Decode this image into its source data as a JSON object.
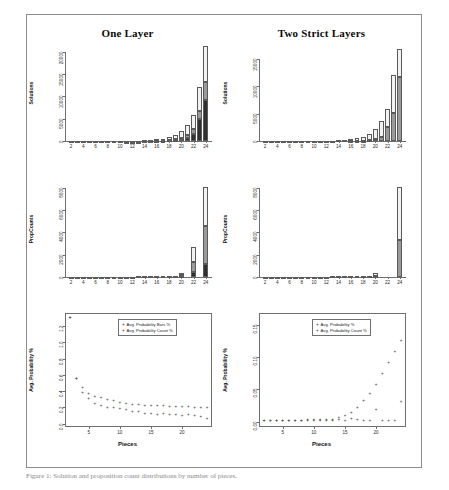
{
  "figure": {
    "caption": "Figure 1: Solution and proposition count distributions by number of pieces.",
    "panels": [
      {
        "id": "top-left",
        "title": "One Layer",
        "ylabel": "Solutions",
        "xlabel": ""
      },
      {
        "id": "top-right",
        "title": "Two Strict Layers",
        "ylabel": "Solutions",
        "xlabel": ""
      },
      {
        "id": "mid-left",
        "title": "",
        "ylabel": "PropCounts",
        "xlabel": ""
      },
      {
        "id": "mid-right",
        "title": "",
        "ylabel": "PropCounts",
        "xlabel": ""
      },
      {
        "id": "bottom-left",
        "title": "",
        "ylabel": "Avg. Probability %",
        "xlabel": "Pieces"
      },
      {
        "id": "bottom-right",
        "title": "",
        "ylabel": "Avg. Probability %",
        "xlabel": "Pieces"
      }
    ]
  },
  "colors": {
    "segment_top": "#f2f2f0",
    "segment_mid": "#9a9a9a",
    "segment_bottom": "#303030",
    "axis": "#6f6f6f",
    "frame": "#8d8d8d",
    "point": "#3a3a3a"
  },
  "chart_data": [
    {
      "type": "bar",
      "id": "top-left",
      "title": "One Layer",
      "xlabel": "",
      "ylabel": "Solutions",
      "xticks": [
        2,
        4,
        6,
        8,
        10,
        12,
        14,
        16,
        18,
        20,
        22,
        24
      ],
      "yticks": [
        0,
        5000,
        10000,
        15000,
        20000
      ],
      "ylim": [
        0,
        21500
      ],
      "xlim": [
        1,
        25
      ],
      "grid": false,
      "stacked": true,
      "segment_names": [
        "bottom-dark",
        "mid-gray",
        "top-white"
      ],
      "x": [
        2,
        3,
        4,
        5,
        6,
        7,
        8,
        9,
        10,
        11,
        12,
        13,
        14,
        15,
        16,
        17,
        18,
        19,
        20,
        21,
        22,
        23,
        24
      ],
      "series": [
        {
          "name": "bottom-dark",
          "values": [
            0,
            0,
            0,
            0,
            0,
            0,
            0,
            0,
            0,
            0,
            5,
            8,
            14,
            25,
            45,
            80,
            150,
            260,
            430,
            760,
            1500,
            4900,
            9200
          ]
        },
        {
          "name": "mid-gray",
          "values": [
            0,
            0,
            0,
            0,
            0,
            0,
            0,
            0,
            0,
            3,
            5,
            8,
            12,
            20,
            35,
            60,
            110,
            190,
            320,
            560,
            1100,
            1900,
            4100
          ]
        },
        {
          "name": "top-white",
          "values": [
            2,
            3,
            4,
            5,
            6,
            8,
            10,
            14,
            20,
            30,
            45,
            70,
            110,
            170,
            260,
            400,
            620,
            950,
            1450,
            2200,
            3200,
            5200,
            8000
          ]
        }
      ],
      "totals": [
        2,
        3,
        4,
        5,
        6,
        8,
        10,
        14,
        20,
        33,
        55,
        86,
        136,
        215,
        340,
        540,
        880,
        1400,
        2200,
        3520,
        5800,
        12000,
        21300
      ]
    },
    {
      "type": "bar",
      "id": "top-right",
      "title": "Two Strict Layers",
      "xlabel": "",
      "ylabel": "Solutions",
      "xticks": [
        2,
        4,
        6,
        8,
        10,
        12,
        14,
        16,
        18,
        20,
        22,
        24
      ],
      "yticks": [
        0,
        5000,
        10000,
        15000
      ],
      "ylim": [
        0,
        17500
      ],
      "xlim": [
        1,
        25
      ],
      "grid": false,
      "stacked": true,
      "segment_names": [
        "bottom-gray",
        "top-white"
      ],
      "x": [
        2,
        3,
        4,
        5,
        6,
        7,
        8,
        9,
        10,
        11,
        12,
        13,
        14,
        15,
        16,
        17,
        18,
        19,
        20,
        21,
        22,
        23,
        24
      ],
      "series": [
        {
          "name": "bottom-gray",
          "values": [
            0,
            0,
            0,
            0,
            0,
            0,
            0,
            0,
            0,
            0,
            0,
            0,
            0,
            0,
            10,
            25,
            60,
            140,
            330,
            800,
            2500,
            5100,
            11700
          ]
        },
        {
          "name": "top-white",
          "values": [
            2,
            3,
            4,
            5,
            6,
            8,
            10,
            14,
            20,
            30,
            45,
            70,
            110,
            180,
            290,
            460,
            740,
            1160,
            1870,
            2900,
            3300,
            7000,
            5100
          ]
        }
      ],
      "totals": [
        2,
        3,
        4,
        5,
        6,
        8,
        10,
        14,
        20,
        30,
        45,
        70,
        110,
        180,
        300,
        485,
        800,
        1300,
        2200,
        3700,
        5800,
        12100,
        16800
      ]
    },
    {
      "type": "bar",
      "id": "mid-left",
      "title": "",
      "xlabel": "",
      "ylabel": "PropCounts",
      "xticks": [
        2,
        4,
        6,
        8,
        10,
        12,
        14,
        16,
        18,
        20,
        22,
        24
      ],
      "yticks": [
        0,
        2000,
        4000,
        6000,
        8000
      ],
      "ylim": [
        0,
        8600
      ],
      "xlim": [
        1,
        25
      ],
      "grid": false,
      "stacked": true,
      "segment_names": [
        "bottom-dark",
        "mid-gray",
        "top-white"
      ],
      "x": [
        2,
        3,
        4,
        5,
        6,
        7,
        8,
        9,
        10,
        11,
        12,
        13,
        14,
        15,
        16,
        17,
        18,
        19,
        20,
        21,
        22,
        23,
        24
      ],
      "series": [
        {
          "name": "bottom-dark",
          "values": [
            0,
            0,
            0,
            0,
            0,
            0,
            0,
            0,
            0,
            0,
            0,
            0,
            0,
            0,
            0,
            0,
            0,
            0,
            80,
            0,
            430,
            0,
            1200
          ]
        },
        {
          "name": "mid-gray",
          "values": [
            0,
            0,
            0,
            0,
            0,
            0,
            0,
            0,
            0,
            0,
            0,
            0,
            0,
            0,
            0,
            0,
            0,
            0,
            60,
            0,
            900,
            0,
            3400
          ]
        },
        {
          "name": "top-white",
          "values": [
            12,
            14,
            16,
            18,
            20,
            22,
            24,
            28,
            32,
            36,
            42,
            48,
            55,
            62,
            70,
            78,
            88,
            100,
            260,
            0,
            1350,
            0,
            3500
          ]
        }
      ],
      "totals": [
        12,
        14,
        16,
        18,
        20,
        22,
        24,
        28,
        32,
        36,
        42,
        48,
        55,
        62,
        70,
        78,
        88,
        100,
        400,
        0,
        2680,
        0,
        8100
      ]
    },
    {
      "type": "bar",
      "id": "mid-right",
      "title": "",
      "xlabel": "",
      "ylabel": "PropCounts",
      "xticks": [
        2,
        4,
        6,
        8,
        10,
        12,
        14,
        16,
        18,
        20,
        22,
        24
      ],
      "yticks": [
        0,
        2000,
        4000,
        6000,
        8000
      ],
      "ylim": [
        0,
        8600
      ],
      "xlim": [
        1,
        25
      ],
      "grid": false,
      "stacked": true,
      "segment_names": [
        "bottom-gray",
        "top-white"
      ],
      "x": [
        2,
        3,
        4,
        5,
        6,
        7,
        8,
        9,
        10,
        11,
        12,
        13,
        14,
        15,
        16,
        17,
        18,
        19,
        20,
        21,
        22,
        23,
        24
      ],
      "series": [
        {
          "name": "bottom-gray",
          "values": [
            0,
            0,
            0,
            0,
            0,
            0,
            0,
            0,
            0,
            0,
            0,
            0,
            0,
            0,
            0,
            0,
            0,
            0,
            60,
            0,
            0,
            0,
            3300
          ]
        },
        {
          "name": "top-white",
          "values": [
            12,
            14,
            16,
            18,
            20,
            22,
            24,
            28,
            32,
            36,
            42,
            48,
            55,
            70,
            90,
            100,
            110,
            120,
            260,
            0,
            0,
            0,
            4800
          ]
        }
      ],
      "totals": [
        12,
        14,
        16,
        18,
        20,
        22,
        24,
        28,
        32,
        36,
        42,
        48,
        55,
        70,
        90,
        100,
        110,
        120,
        320,
        0,
        0,
        0,
        8100
      ]
    },
    {
      "type": "scatter",
      "id": "bottom-left",
      "title": "",
      "xlabel": "Pieces",
      "ylabel": "Avg. Probability %",
      "xticks": [
        5,
        10,
        15,
        20
      ],
      "yticks": [
        0.0,
        0.2,
        0.4,
        0.6,
        0.8,
        1.0,
        1.2
      ],
      "ytick_labels": [
        "0.0",
        "0.2",
        "0.4",
        "0.6",
        "0.8",
        "1.0",
        "1.2"
      ],
      "ylim": [
        -0.04,
        1.36
      ],
      "xlim": [
        1.2,
        24.8
      ],
      "grid": false,
      "legend_position": "top-center",
      "series": [
        {
          "name": "Avg. Probability Bars %",
          "x": [
            2,
            3,
            4,
            5,
            6,
            7,
            8,
            9,
            10,
            11,
            12,
            13,
            14,
            15,
            16,
            17,
            18,
            19,
            20,
            21,
            22,
            23,
            24
          ],
          "y": [
            1.3,
            0.54,
            0.43,
            0.36,
            0.33,
            0.31,
            0.29,
            0.27,
            0.25,
            0.24,
            0.23,
            0.225,
            0.22,
            0.215,
            0.212,
            0.21,
            0.208,
            0.205,
            0.2,
            0.198,
            0.195,
            0.19,
            0.185
          ]
        },
        {
          "name": "Avg. Probability Count %",
          "x": [
            2,
            3,
            4,
            5,
            6,
            7,
            8,
            9,
            10,
            11,
            12,
            13,
            14,
            15,
            16,
            17,
            18,
            19,
            20,
            21,
            22,
            23,
            24
          ],
          "y": [
            1.3,
            0.54,
            0.37,
            0.3,
            0.24,
            0.22,
            0.19,
            0.195,
            0.175,
            0.165,
            0.135,
            0.145,
            0.115,
            0.12,
            0.105,
            0.11,
            0.1,
            0.105,
            0.095,
            0.1,
            0.09,
            0.075,
            0.055
          ]
        }
      ]
    },
    {
      "type": "scatter",
      "id": "bottom-right",
      "title": "",
      "xlabel": "Pieces",
      "ylabel": "Avg. Probability %",
      "xticks": [
        5,
        10,
        15,
        20
      ],
      "yticks": [
        0.0,
        0.05,
        0.1,
        0.15
      ],
      "ytick_labels": [
        "0.00",
        "0.05",
        "0.10",
        "0.15"
      ],
      "ylim": [
        -0.008,
        0.168
      ],
      "xlim": [
        1.2,
        24.8
      ],
      "grid": false,
      "legend_position": "top-center",
      "series": [
        {
          "name": "Avg. Probability %",
          "x": [
            2,
            3,
            4,
            5,
            6,
            7,
            8,
            9,
            10,
            11,
            12,
            13,
            14,
            15,
            16,
            17,
            18,
            19,
            20,
            21,
            22,
            23,
            24
          ],
          "y": [
            0.001,
            0.001,
            0.001,
            0.001,
            0.001,
            0.001,
            0.0015,
            0.002,
            0.002,
            0.002,
            0.0025,
            0.003,
            0.005,
            0.008,
            0.013,
            0.021,
            0.031,
            0.043,
            0.057,
            0.073,
            0.09,
            0.108,
            0.125
          ]
        },
        {
          "name": "Avg. Probability Count %",
          "x": [
            2,
            3,
            4,
            5,
            6,
            7,
            8,
            9,
            10,
            11,
            12,
            13,
            14,
            15,
            16,
            17,
            18,
            19,
            20,
            21,
            22,
            23,
            24
          ],
          "y": [
            0.001,
            0.001,
            0.001,
            0.001,
            0.001,
            0.001,
            0.001,
            0.001,
            0.001,
            0.001,
            0.001,
            0.001,
            0.002,
            0.0015,
            0.004,
            0.002,
            0.001,
            0.001,
            0.018,
            0.001,
            0.001,
            0.001,
            0.03
          ]
        }
      ]
    }
  ],
  "legends": {
    "bottom_left": [
      "Avg. Probability Bars %",
      "Avg. Probability Count %"
    ],
    "bottom_right": [
      "Avg. Probability %",
      "Avg. Probability Count %"
    ]
  }
}
